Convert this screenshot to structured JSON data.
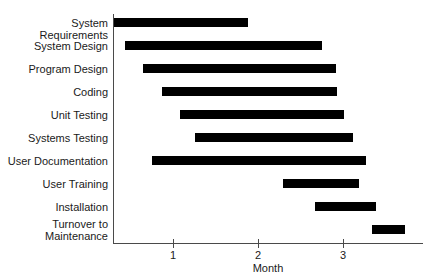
{
  "chart_data": {
    "type": "bar",
    "subtype": "gantt",
    "title": "",
    "xlabel": "Month",
    "ylabel": "",
    "xlim": [
      0,
      3.9
    ],
    "xticks": [
      1,
      2,
      3
    ],
    "xtick_labels": [
      "1",
      "2",
      "3"
    ],
    "grid": false,
    "legend": null,
    "bar_color": "#000000",
    "axis_color": "#4a4a4a",
    "categories": [
      "System Requirements",
      "System Design",
      "Program Design",
      "Coding",
      "Unit Testing",
      "Systems Testing",
      "User Documentation",
      "User Training",
      "Installation",
      "Turnover to Maintenance"
    ],
    "tasks": [
      {
        "label": "System Requirements",
        "label_lines": [
          "System Requirements"
        ],
        "start": 0.31,
        "end": 1.88
      },
      {
        "label": "System Design",
        "label_lines": [
          "System Design"
        ],
        "start": 0.44,
        "end": 2.75
      },
      {
        "label": "Program Design",
        "label_lines": [
          "Program Design"
        ],
        "start": 0.65,
        "end": 2.92
      },
      {
        "label": "Coding",
        "label_lines": [
          "Coding"
        ],
        "start": 0.87,
        "end": 2.93
      },
      {
        "label": "Unit Testing",
        "label_lines": [
          "Unit Testing"
        ],
        "start": 1.08,
        "end": 3.01
      },
      {
        "label": "Systems Testing",
        "label_lines": [
          "Systems Testing"
        ],
        "start": 1.26,
        "end": 3.12
      },
      {
        "label": "User Documentation",
        "label_lines": [
          "User Documentation"
        ],
        "start": 0.75,
        "end": 3.27
      },
      {
        "label": "User Training",
        "label_lines": [
          "User Training"
        ],
        "start": 2.29,
        "end": 3.19
      },
      {
        "label": "Installation",
        "label_lines": [
          "Installation"
        ],
        "start": 2.67,
        "end": 3.39
      },
      {
        "label": "Turnover to Maintenance",
        "label_lines": [
          "Turnover to",
          "Maintenance"
        ],
        "start": 3.34,
        "end": 3.73
      }
    ]
  }
}
